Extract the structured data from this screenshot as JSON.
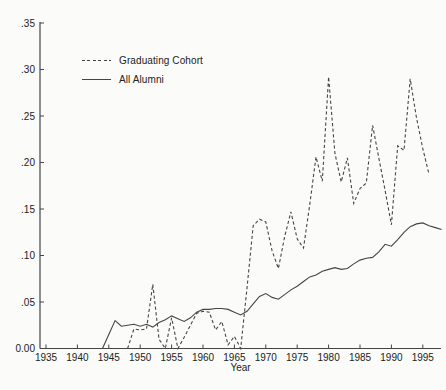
{
  "axis_color": "#454545",
  "text_color": "#222222",
  "line_color": "#454545",
  "background_color": "#fbfbf9",
  "legend": {
    "items": [
      {
        "label": "Graduating Cohort",
        "style": "dashed"
      },
      {
        "label": "All Alumni",
        "style": "solid"
      }
    ]
  },
  "chart_data": {
    "type": "line",
    "title": "",
    "xlabel": "Year",
    "ylabel": "",
    "xlim": [
      1933.5,
      1998.8
    ],
    "ylim": [
      0,
      0.35
    ],
    "grid": false,
    "legend_position": "upper-left",
    "x_ticks": [
      1935,
      1940,
      1945,
      1950,
      1955,
      1960,
      1965,
      1970,
      1975,
      1980,
      1985,
      1990,
      1995
    ],
    "y_ticks": [
      {
        "value": 0.0,
        "label": "0.00"
      },
      {
        "value": 0.05,
        "label": ".05"
      },
      {
        "value": 0.1,
        "label": ".10"
      },
      {
        "value": 0.15,
        "label": ".15"
      },
      {
        "value": 0.2,
        "label": ".20"
      },
      {
        "value": 0.25,
        "label": ".25"
      },
      {
        "value": 0.3,
        "label": ".30"
      },
      {
        "value": 0.35,
        "label": ".35"
      }
    ],
    "series": [
      {
        "name": "Graduating Cohort",
        "line_style": "dashed",
        "x": [
          1948,
          1949,
          1950,
          1951,
          1952,
          1953,
          1954,
          1955,
          1956,
          1957,
          1958,
          1959,
          1960,
          1961,
          1962,
          1963,
          1964,
          1965,
          1966,
          1967,
          1968,
          1969,
          1970,
          1971,
          1972,
          1973,
          1974,
          1975,
          1976,
          1977,
          1978,
          1979,
          1980,
          1981,
          1982,
          1983,
          1984,
          1985,
          1986,
          1987,
          1988,
          1989,
          1990,
          1991,
          1992,
          1993,
          1994,
          1995,
          1996
        ],
        "y": [
          0.0,
          0.021,
          0.02,
          0.021,
          0.069,
          0.01,
          0.0,
          0.033,
          0.0,
          0.012,
          0.025,
          0.038,
          0.04,
          0.039,
          0.02,
          0.029,
          0.004,
          0.013,
          0.0,
          0.065,
          0.132,
          0.139,
          0.136,
          0.105,
          0.086,
          0.12,
          0.147,
          0.118,
          0.108,
          0.155,
          0.206,
          0.18,
          0.292,
          0.21,
          0.179,
          0.205,
          0.156,
          0.172,
          0.178,
          0.24,
          0.205,
          0.17,
          0.133,
          0.218,
          0.213,
          0.29,
          0.248,
          0.215,
          0.187
        ]
      },
      {
        "name": "All Alumni",
        "line_style": "solid",
        "x": [
          1944,
          1945,
          1946,
          1947,
          1948,
          1949,
          1950,
          1951,
          1952,
          1953,
          1954,
          1955,
          1956,
          1957,
          1958,
          1959,
          1960,
          1961,
          1962,
          1963,
          1964,
          1965,
          1966,
          1967,
          1968,
          1969,
          1970,
          1971,
          1972,
          1973,
          1974,
          1975,
          1976,
          1977,
          1978,
          1979,
          1980,
          1981,
          1982,
          1983,
          1984,
          1985,
          1986,
          1987,
          1988,
          1989,
          1990,
          1991,
          1992,
          1993,
          1994,
          1995,
          1996,
          1997,
          1998
        ],
        "y": [
          0.0,
          0.015,
          0.03,
          0.024,
          0.025,
          0.026,
          0.024,
          0.026,
          0.023,
          0.028,
          0.031,
          0.035,
          0.032,
          0.029,
          0.033,
          0.039,
          0.042,
          0.042,
          0.043,
          0.043,
          0.042,
          0.039,
          0.036,
          0.04,
          0.048,
          0.056,
          0.059,
          0.055,
          0.053,
          0.058,
          0.063,
          0.067,
          0.072,
          0.077,
          0.079,
          0.083,
          0.085,
          0.087,
          0.085,
          0.086,
          0.091,
          0.095,
          0.097,
          0.098,
          0.104,
          0.112,
          0.11,
          0.117,
          0.125,
          0.131,
          0.134,
          0.135,
          0.132,
          0.13,
          0.128
        ]
      }
    ]
  }
}
